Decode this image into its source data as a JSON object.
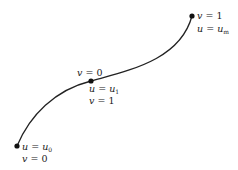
{
  "diagram": {
    "type": "parametric-curve",
    "curve_color": "#222222",
    "points": [
      {
        "id": "start",
        "x": 17,
        "y": 146,
        "labels": [
          {
            "var": "u",
            "eq": " = ",
            "val": "u",
            "sub": "0"
          },
          {
            "var": "v",
            "eq": " = ",
            "val": "0",
            "sub": ""
          }
        ]
      },
      {
        "id": "middle",
        "x": 91,
        "y": 81,
        "label_above": {
          "var": "v",
          "eq": " = ",
          "val": "0",
          "sub": ""
        },
        "labels": [
          {
            "var": "u",
            "eq": " = ",
            "val": "u",
            "sub": "1"
          },
          {
            "var": "v",
            "eq": " = ",
            "val": "1",
            "sub": ""
          }
        ]
      },
      {
        "id": "end",
        "x": 192,
        "y": 16,
        "labels": [
          {
            "var": "v",
            "eq": " = ",
            "val": "1",
            "sub": ""
          },
          {
            "var": "u",
            "eq": " = ",
            "val": "u",
            "sub": "m"
          }
        ]
      }
    ]
  }
}
